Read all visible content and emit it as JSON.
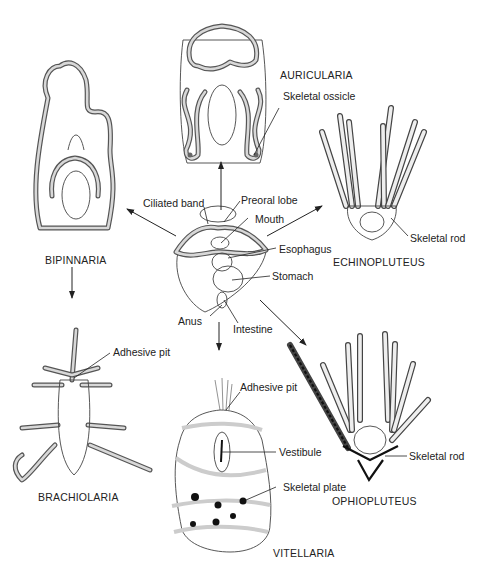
{
  "figure": {
    "central_larva": {
      "labels": {
        "ciliated_band": "Ciliated band",
        "preoral_lobe": "Preoral lobe",
        "mouth": "Mouth",
        "esophagus": "Esophagus",
        "stomach": "Stomach",
        "anus": "Anus",
        "intestine": "Intestine"
      }
    },
    "larvae": [
      {
        "id": "auricularia",
        "name": "AURICULARIA",
        "labels": [
          "Skeletal ossicle"
        ]
      },
      {
        "id": "echinopluteus",
        "name": "ECHINOPLUTEUS",
        "labels": [
          "Skeletal rod"
        ]
      },
      {
        "id": "bipinnaria",
        "name": "BIPINNARIA",
        "labels": []
      },
      {
        "id": "brachiolaria",
        "name": "BRACHIOLARIA",
        "labels": [
          "Adhesive pit"
        ]
      },
      {
        "id": "vitellaria",
        "name": "VITELLARIA",
        "labels": [
          "Adhesive pit",
          "Vestibule",
          "Skeletal plate"
        ]
      },
      {
        "id": "ophiopluteus",
        "name": "OPHIOPLUTEUS",
        "labels": [
          "Skeletal rod"
        ]
      }
    ],
    "arrows": [
      {
        "from": "central_larva",
        "to": "auricularia"
      },
      {
        "from": "central_larva",
        "to": "echinopluteus"
      },
      {
        "from": "central_larva",
        "to": "bipinnaria"
      },
      {
        "from": "bipinnaria",
        "to": "brachiolaria"
      },
      {
        "from": "central_larva",
        "to": "vitellaria"
      },
      {
        "from": "central_larva",
        "to": "ophiopluteus"
      }
    ]
  }
}
